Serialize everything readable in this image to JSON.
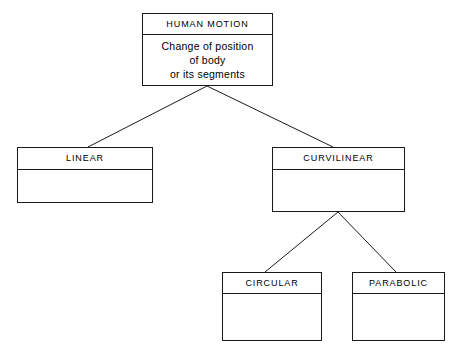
{
  "diagram": {
    "line_color": "#1a1a1a",
    "background_color": "#ffffff",
    "text_color": "#000000",
    "nodes": {
      "human_motion": {
        "header": "HUMAN MOTION",
        "body": "Change of position\nof body\nor its segments"
      },
      "linear": {
        "header": "LINEAR",
        "body": ""
      },
      "curvilinear": {
        "header": "CURVILINEAR",
        "body": ""
      },
      "circular": {
        "header": "CIRCULAR",
        "body": ""
      },
      "parabolic": {
        "header": "PARABOLIC",
        "body": ""
      }
    }
  }
}
